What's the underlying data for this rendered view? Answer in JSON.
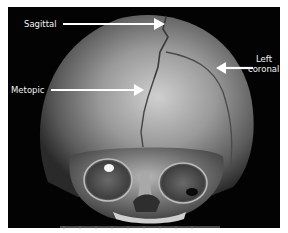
{
  "figure": {
    "annotations": [
      {
        "id": "sagittal",
        "label": "Sagittal"
      },
      {
        "id": "metopic",
        "label": "Metopic"
      },
      {
        "id": "left_coronal",
        "label_line1": "Left",
        "label_line2": "coronal"
      }
    ],
    "scale_bar_label": "1 cm",
    "colors": {
      "background": "#030303",
      "bone_light": "#d8d8d8",
      "bone_mid": "#8a8a8a",
      "bone_dark": "#3a3a3a",
      "label_text": "#f2f2f2",
      "arrow": "#ffffff"
    }
  }
}
